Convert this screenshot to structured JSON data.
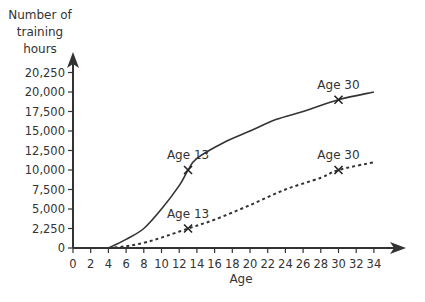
{
  "chart_data": {
    "type": "line",
    "title": "",
    "xlabel": "Age",
    "ylabel": "Number of training hours",
    "ylabel_lines": [
      "Number of",
      "training",
      "hours"
    ],
    "x_ticks": [
      0,
      2,
      4,
      6,
      8,
      10,
      12,
      14,
      16,
      18,
      20,
      22,
      24,
      26,
      28,
      30,
      32,
      34
    ],
    "y_ticks": [
      "0",
      "2,250",
      "5,000",
      "7,500",
      "10,000",
      "12,500",
      "15,000",
      "17,500",
      "20,000",
      "20,250"
    ],
    "y_tick_values": [
      0,
      2250,
      5000,
      7500,
      10000,
      12500,
      15000,
      17500,
      20000,
      20250
    ],
    "xlim": [
      0,
      36
    ],
    "ylim": [
      0,
      20250
    ],
    "grid": false,
    "legend": null,
    "series": [
      {
        "name": "solid",
        "style": "solid",
        "x": [
          4,
          6,
          8,
          10,
          12,
          13,
          14,
          17,
          20,
          23,
          26,
          30,
          34
        ],
        "values": [
          0,
          1000,
          2250,
          5000,
          8000,
          10000,
          11500,
          13500,
          15000,
          16500,
          17500,
          19000,
          20000
        ]
      },
      {
        "name": "dashed",
        "style": "dashed",
        "x": [
          4,
          6,
          8,
          10,
          13,
          16,
          20,
          24,
          28,
          30,
          34
        ],
        "values": [
          0,
          200,
          600,
          1200,
          2250,
          3500,
          5500,
          7500,
          9000,
          10000,
          11000
        ]
      }
    ],
    "annotations": [
      {
        "label": "Age 13",
        "series": "solid",
        "x": 13,
        "y": 10000,
        "marker": "x"
      },
      {
        "label": "Age 30",
        "series": "solid",
        "x": 30,
        "y": 19000,
        "marker": "x"
      },
      {
        "label": "Age 13",
        "series": "dashed",
        "x": 13,
        "y": 2250,
        "marker": "x"
      },
      {
        "label": "Age 30",
        "series": "dashed",
        "x": 30,
        "y": 10000,
        "marker": "x"
      }
    ]
  }
}
